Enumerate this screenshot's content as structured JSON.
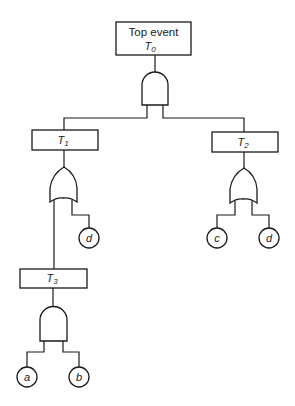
{
  "diagram": {
    "type": "fault-tree",
    "top_event": {
      "title": "Top event",
      "symbol": "T",
      "sub": "0"
    },
    "top_gate": "AND",
    "events": [
      {
        "id": "T1",
        "symbol": "T",
        "sub": "1",
        "gate": "OR",
        "inputs": [
          "T3",
          "d"
        ]
      },
      {
        "id": "T2",
        "symbol": "T",
        "sub": "2",
        "gate": "OR",
        "inputs": [
          "c",
          "d"
        ]
      },
      {
        "id": "T3",
        "symbol": "T",
        "sub": "3",
        "gate": "AND",
        "inputs": [
          "a",
          "b"
        ]
      }
    ],
    "basic_events": {
      "t1_d": "d",
      "t2_c": "c",
      "t2_d": "d",
      "t3_a": "a",
      "t3_b": "b"
    },
    "colors": {
      "line": "#1a1a1a",
      "background": "#ffffff"
    }
  }
}
